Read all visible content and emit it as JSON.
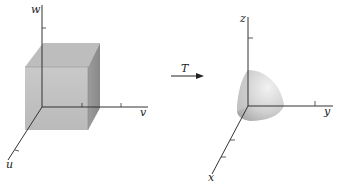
{
  "diagram": {
    "left": {
      "axes": {
        "vertical": "w",
        "horizontal": "v",
        "diagonal": "u"
      },
      "shape": "cube"
    },
    "transform": {
      "label": "T",
      "icon": "right-arrow-icon"
    },
    "right": {
      "axes": {
        "vertical": "z",
        "horizontal": "y",
        "diagonal": "x"
      },
      "shape": "spherical-octant"
    },
    "colors": {
      "axis": "#333333",
      "shape_fill": "#c8c8c8",
      "shape_dark": "#9a9a9a"
    }
  }
}
